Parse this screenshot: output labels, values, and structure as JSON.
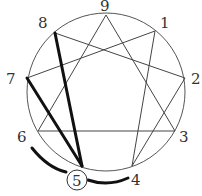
{
  "diagram": {
    "highlighted_point": "5",
    "colors": {
      "line": "#555555",
      "bold": "#111111",
      "label": "#333333",
      "background": "#ffffff"
    },
    "points": [
      {
        "label": "9",
        "x": 106,
        "y": 15,
        "lx": 104,
        "ly": 10
      },
      {
        "label": "1",
        "x": 155,
        "y": 31,
        "lx": 162,
        "ly": 28
      },
      {
        "label": "2",
        "x": 185,
        "y": 78,
        "lx": 192,
        "ly": 85
      },
      {
        "label": "3",
        "x": 175,
        "y": 131,
        "lx": 180,
        "ly": 143
      },
      {
        "label": "4",
        "x": 132,
        "y": 166,
        "lx": 134,
        "ly": 185
      },
      {
        "label": "5",
        "x": 82,
        "y": 166,
        "lx": 72,
        "ly": 185
      },
      {
        "label": "6",
        "x": 38,
        "y": 131,
        "lx": 18,
        "ly": 143
      },
      {
        "label": "7",
        "x": 27,
        "y": 78,
        "lx": 7,
        "ly": 85
      },
      {
        "label": "8",
        "x": 55,
        "y": 33,
        "lx": 38,
        "ly": 28
      }
    ],
    "thin_lines": [
      [
        "9",
        "3"
      ],
      [
        "3",
        "6"
      ],
      [
        "6",
        "9"
      ],
      [
        "1",
        "4"
      ],
      [
        "4",
        "2"
      ],
      [
        "2",
        "8"
      ],
      [
        "8",
        "5"
      ],
      [
        "5",
        "7"
      ],
      [
        "7",
        "1"
      ]
    ],
    "bold_lines": [
      [
        "8",
        "5"
      ],
      [
        "7",
        "5"
      ]
    ],
    "arcs": [
      {
        "from": "6",
        "to": "5",
        "label": "wing-6"
      },
      {
        "from": "5",
        "to": "4",
        "label": "wing-4"
      }
    ]
  }
}
